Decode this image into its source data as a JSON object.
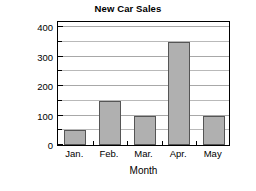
{
  "chart_data": {
    "type": "bar",
    "title": "New Car Sales",
    "xlabel": "Month",
    "ylabel": "Number of cars",
    "categories": [
      "Jan.",
      "Feb.",
      "Mar.",
      "Apr.",
      "May"
    ],
    "values": [
      50,
      150,
      100,
      350,
      100
    ],
    "ylim": [
      0,
      425
    ],
    "ytick_values": [
      0,
      100,
      200,
      300,
      400
    ],
    "ytick_labels": [
      "0",
      "100",
      "200",
      "300",
      "400"
    ],
    "minor_tick_values": [
      50,
      150,
      250,
      350,
      400
    ],
    "gridlines": {
      "visible": true,
      "orientation": "horizontal",
      "interval": 50,
      "values": [
        50,
        100,
        150,
        200,
        250,
        300,
        350,
        400
      ],
      "color": "#b9b9b9"
    },
    "legend": null,
    "bar_color": "#b0b0b0",
    "bar_edge_color": "#555555",
    "frame_color": "#000000",
    "background_color": "#ffffff"
  }
}
